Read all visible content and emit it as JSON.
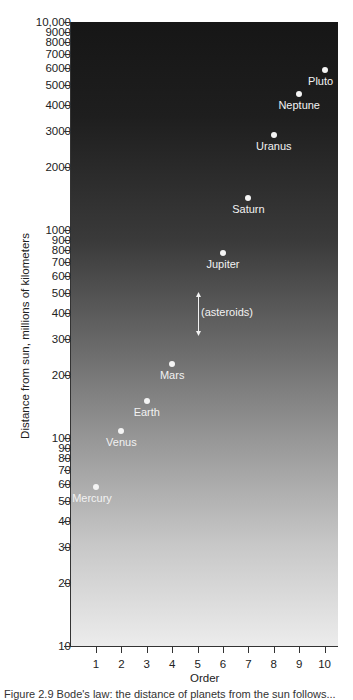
{
  "chart_data": {
    "type": "scatter",
    "title": "",
    "xlabel": "Order",
    "ylabel": "Distance from sun, millions of kilometers",
    "yscale": "log",
    "ylim": [
      10,
      10000
    ],
    "xlim": [
      0,
      10.5
    ],
    "x_ticks": [
      "1",
      "2",
      "3",
      "4",
      "5",
      "6",
      "7",
      "8",
      "9",
      "10"
    ],
    "y_ticks": [
      "10",
      "20",
      "30",
      "40",
      "50",
      "60",
      "70",
      "80",
      "90",
      "100",
      "200",
      "300",
      "400",
      "500",
      "600",
      "700",
      "800",
      "900",
      "1000",
      "2000",
      "3000",
      "4000",
      "5000",
      "6000",
      "7000",
      "8000",
      "9000",
      "10,000"
    ],
    "grid": false,
    "points": [
      {
        "name": "Mercury",
        "x": 1,
        "y": 58
      },
      {
        "name": "Venus",
        "x": 2,
        "y": 108
      },
      {
        "name": "Earth",
        "x": 3,
        "y": 150
      },
      {
        "name": "Mars",
        "x": 4,
        "y": 228
      },
      {
        "name": "Jupiter",
        "x": 6,
        "y": 778
      },
      {
        "name": "Saturn",
        "x": 7,
        "y": 1427
      },
      {
        "name": "Uranus",
        "x": 8,
        "y": 2870
      },
      {
        "name": "Neptune",
        "x": 9,
        "y": 4497
      },
      {
        "name": "Pluto",
        "x": 10,
        "y": 5900
      }
    ],
    "annotations": [
      {
        "text": "(asteroids)",
        "x": 5,
        "y_range": [
          300,
          450
        ],
        "type": "double-arrow"
      }
    ]
  },
  "caption": "Figure 2.9  Bode's law: the distance of planets from the sun follows..."
}
